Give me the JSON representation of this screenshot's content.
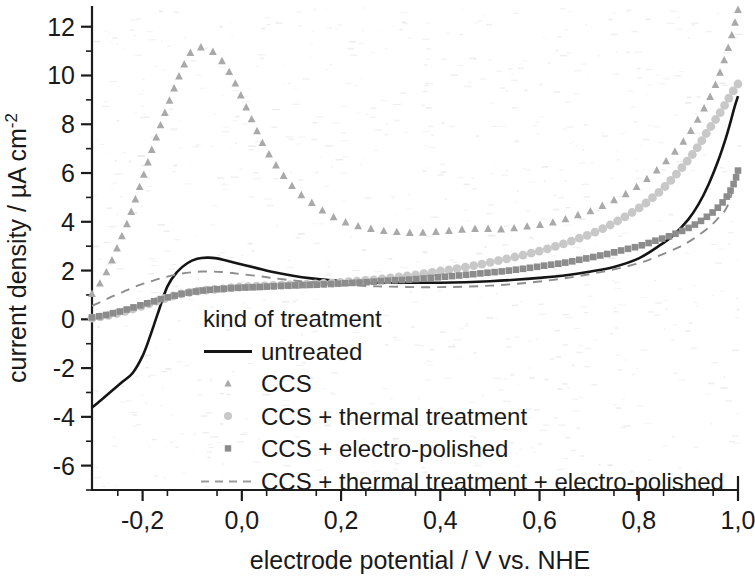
{
  "chart_data": {
    "type": "line",
    "title": "",
    "xlabel": "electrode potential / V vs. NHE",
    "ylabel_main": "current density / ",
    "ylabel_unit": "µA cm",
    "ylabel_exp": "-2",
    "xlim": [
      -0.302,
      1.0
    ],
    "ylim": [
      -7.0,
      12.85
    ],
    "xticks": [
      -0.2,
      0.0,
      0.2,
      0.4,
      0.6,
      0.8,
      1.0
    ],
    "xticklabels": [
      "-0,2",
      "0,0",
      "0,2",
      "0,4",
      "0,6",
      "0,8",
      "1,0"
    ],
    "yticks": [
      -6,
      -4,
      -2,
      0,
      2,
      4,
      6,
      8,
      10,
      12
    ],
    "yticklabels": [
      "-6",
      "-4",
      "-2",
      "0",
      "2",
      "4",
      "6",
      "8",
      "10",
      "12"
    ],
    "x_minor_step": 0.05,
    "y_minor_step": 1,
    "grid": false,
    "legend_position": "inside-lower-left",
    "legend_title": "kind of treatment",
    "series": [
      {
        "name": "untreated",
        "style": "solid-line",
        "color": "#151515",
        "x": [
          -0.302,
          -0.28,
          -0.26,
          -0.24,
          -0.22,
          -0.2,
          -0.185,
          -0.17,
          -0.15,
          -0.13,
          -0.11,
          -0.09,
          -0.07,
          -0.05,
          -0.03,
          0.0,
          0.03,
          0.06,
          0.1,
          0.14,
          0.18,
          0.22,
          0.26,
          0.3,
          0.35,
          0.4,
          0.45,
          0.5,
          0.55,
          0.6,
          0.65,
          0.7,
          0.75,
          0.8,
          0.84,
          0.87,
          0.9,
          0.92,
          0.94,
          0.96,
          0.975,
          0.985,
          0.993,
          1.0
        ],
        "y": [
          -3.62,
          -3.25,
          -2.9,
          -2.55,
          -2.2,
          -1.5,
          -0.7,
          0.2,
          1.35,
          1.95,
          2.3,
          2.48,
          2.53,
          2.5,
          2.4,
          2.25,
          2.1,
          1.95,
          1.8,
          1.68,
          1.6,
          1.55,
          1.52,
          1.5,
          1.5,
          1.5,
          1.52,
          1.56,
          1.62,
          1.7,
          1.8,
          1.95,
          2.15,
          2.5,
          3.0,
          3.45,
          4.1,
          4.7,
          5.5,
          6.5,
          7.4,
          8.1,
          8.7,
          9.15
        ]
      },
      {
        "name": "CCS",
        "style": "triangle-markers",
        "color": "#a9a9a9",
        "x": [
          -0.302,
          -0.29,
          -0.28,
          -0.27,
          -0.26,
          -0.25,
          -0.24,
          -0.23,
          -0.22,
          -0.21,
          -0.2,
          -0.19,
          -0.18,
          -0.17,
          -0.16,
          -0.15,
          -0.14,
          -0.13,
          -0.12,
          -0.11,
          -0.1,
          -0.09,
          -0.08,
          -0.07,
          -0.06,
          -0.05,
          -0.04,
          -0.03,
          -0.02,
          -0.01,
          0.0,
          0.01,
          0.02,
          0.03,
          0.04,
          0.05,
          0.06,
          0.08,
          0.1,
          0.12,
          0.14,
          0.16,
          0.18,
          0.2,
          0.23,
          0.26,
          0.29,
          0.32,
          0.35,
          0.38,
          0.41,
          0.44,
          0.47,
          0.5,
          0.53,
          0.56,
          0.59,
          0.62,
          0.65,
          0.68,
          0.71,
          0.74,
          0.77,
          0.8,
          0.83,
          0.86,
          0.89,
          0.91,
          0.93,
          0.95,
          0.965,
          0.978,
          0.988,
          0.996,
          1.0
        ],
        "y": [
          1.05,
          1.35,
          1.7,
          2.05,
          2.5,
          3.0,
          3.5,
          4.0,
          4.6,
          5.2,
          5.8,
          6.4,
          7.05,
          7.6,
          8.2,
          8.75,
          9.3,
          9.8,
          10.3,
          10.7,
          11.05,
          11.18,
          11.15,
          11.12,
          11.0,
          10.85,
          10.6,
          10.3,
          9.95,
          9.55,
          9.1,
          8.65,
          8.2,
          7.75,
          7.3,
          6.95,
          6.6,
          6.0,
          5.5,
          5.1,
          4.8,
          4.5,
          4.25,
          4.05,
          3.85,
          3.72,
          3.62,
          3.58,
          3.55,
          3.58,
          3.62,
          3.68,
          3.72,
          3.72,
          3.7,
          3.78,
          3.85,
          3.95,
          4.1,
          4.3,
          4.5,
          4.8,
          5.1,
          5.5,
          6.0,
          6.6,
          7.3,
          7.9,
          8.6,
          9.4,
          10.2,
          11.0,
          11.7,
          12.35,
          12.7
        ]
      },
      {
        "name": "CCS + thermal treatment",
        "style": "circle-markers",
        "color": "#c8c8c8",
        "x": [
          -0.302,
          -0.28,
          -0.26,
          -0.24,
          -0.22,
          -0.2,
          -0.18,
          -0.16,
          -0.14,
          -0.12,
          -0.1,
          -0.08,
          -0.06,
          -0.04,
          -0.02,
          0.0,
          0.02,
          0.05,
          0.08,
          0.11,
          0.14,
          0.17,
          0.2,
          0.24,
          0.28,
          0.32,
          0.36,
          0.4,
          0.44,
          0.48,
          0.52,
          0.56,
          0.6,
          0.63,
          0.66,
          0.69,
          0.72,
          0.75,
          0.78,
          0.81,
          0.84,
          0.86,
          0.88,
          0.9,
          0.92,
          0.94,
          0.955,
          0.968,
          0.978,
          0.988,
          0.995,
          1.0
        ],
        "y": [
          0.05,
          0.12,
          0.2,
          0.3,
          0.42,
          0.55,
          0.68,
          0.82,
          0.95,
          1.05,
          1.12,
          1.18,
          1.22,
          1.25,
          1.3,
          1.33,
          1.35,
          1.38,
          1.4,
          1.42,
          1.45,
          1.48,
          1.52,
          1.58,
          1.65,
          1.75,
          1.85,
          1.98,
          2.1,
          2.25,
          2.42,
          2.6,
          2.8,
          2.98,
          3.18,
          3.4,
          3.65,
          3.95,
          4.3,
          4.7,
          5.2,
          5.6,
          6.05,
          6.55,
          7.1,
          7.75,
          8.2,
          8.6,
          8.95,
          9.3,
          9.5,
          9.65
        ]
      },
      {
        "name": "CCS + electro-polished",
        "style": "square-markers",
        "color": "#8c8c8c",
        "x": [
          -0.302,
          -0.28,
          -0.26,
          -0.24,
          -0.22,
          -0.2,
          -0.18,
          -0.16,
          -0.14,
          -0.12,
          -0.1,
          -0.08,
          -0.06,
          -0.04,
          -0.02,
          0.0,
          0.03,
          0.06,
          0.09,
          0.12,
          0.15,
          0.18,
          0.21,
          0.25,
          0.29,
          0.33,
          0.37,
          0.41,
          0.45,
          0.49,
          0.53,
          0.57,
          0.61,
          0.65,
          0.69,
          0.73,
          0.77,
          0.8,
          0.83,
          0.86,
          0.89,
          0.91,
          0.93,
          0.95,
          0.965,
          0.978,
          0.988,
          0.995,
          1.0
        ],
        "y": [
          0.08,
          0.15,
          0.25,
          0.35,
          0.48,
          0.6,
          0.72,
          0.85,
          0.95,
          1.05,
          1.12,
          1.18,
          1.22,
          1.25,
          1.28,
          1.3,
          1.32,
          1.35,
          1.38,
          1.4,
          1.42,
          1.45,
          1.48,
          1.52,
          1.58,
          1.62,
          1.68,
          1.75,
          1.82,
          1.9,
          1.98,
          2.08,
          2.2,
          2.32,
          2.48,
          2.65,
          2.85,
          3.0,
          3.2,
          3.4,
          3.65,
          3.85,
          4.1,
          4.4,
          4.7,
          5.05,
          5.4,
          5.75,
          6.1
        ]
      },
      {
        "name": "CCS + thermal treatment + electro-polished",
        "style": "dashed-line",
        "color": "#8d8d8d",
        "x": [
          -0.302,
          -0.28,
          -0.26,
          -0.24,
          -0.22,
          -0.2,
          -0.18,
          -0.16,
          -0.14,
          -0.12,
          -0.1,
          -0.08,
          -0.06,
          -0.04,
          -0.02,
          0.0,
          0.03,
          0.06,
          0.1,
          0.14,
          0.18,
          0.22,
          0.26,
          0.3,
          0.35,
          0.4,
          0.45,
          0.5,
          0.55,
          0.6,
          0.65,
          0.7,
          0.75,
          0.8,
          0.84,
          0.88,
          0.91,
          0.94,
          0.96,
          0.98,
          1.0
        ],
        "y": [
          0.55,
          0.75,
          0.95,
          1.12,
          1.3,
          1.45,
          1.58,
          1.7,
          1.8,
          1.88,
          1.93,
          1.96,
          1.96,
          1.94,
          1.9,
          1.85,
          1.78,
          1.7,
          1.6,
          1.52,
          1.45,
          1.4,
          1.36,
          1.34,
          1.32,
          1.32,
          1.34,
          1.38,
          1.45,
          1.55,
          1.68,
          1.85,
          2.05,
          2.3,
          2.6,
          2.95,
          3.3,
          3.75,
          4.15,
          4.7,
          6.15
        ]
      }
    ]
  },
  "legend": {
    "title": "kind of treatment",
    "entries": [
      {
        "label": "untreated",
        "marker": "solid-line-swatch"
      },
      {
        "label": "CCS",
        "marker": "triangle-swatch"
      },
      {
        "label": "CCS + thermal treatment",
        "marker": "circle-swatch"
      },
      {
        "label": "CCS + electro-polished",
        "marker": "square-swatch"
      },
      {
        "label": "CCS + thermal treatment + electro-polished",
        "marker": "dashed-line-swatch"
      }
    ]
  }
}
